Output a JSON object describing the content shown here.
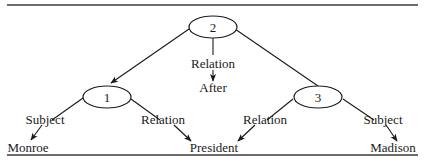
{
  "diagram": {
    "type": "propositional-network",
    "nodes": [
      {
        "id": "n2",
        "label": "2"
      },
      {
        "id": "n1",
        "label": "1"
      },
      {
        "id": "n3",
        "label": "3"
      }
    ],
    "leaves": [
      {
        "id": "monroe",
        "label": "Monroe"
      },
      {
        "id": "president",
        "label": "President"
      },
      {
        "id": "after",
        "label": "After"
      },
      {
        "id": "madison",
        "label": "Madison"
      }
    ],
    "edges": [
      {
        "from": "n2",
        "to": "n1",
        "label": ""
      },
      {
        "from": "n2",
        "to": "after",
        "label": "Relation"
      },
      {
        "from": "n2",
        "to": "n3",
        "label": ""
      },
      {
        "from": "n1",
        "to": "monroe",
        "label": "Subject"
      },
      {
        "from": "n1",
        "to": "president",
        "label": "Relation"
      },
      {
        "from": "n3",
        "to": "president",
        "label": "Relation"
      },
      {
        "from": "n3",
        "to": "madison",
        "label": "Subject"
      }
    ]
  }
}
